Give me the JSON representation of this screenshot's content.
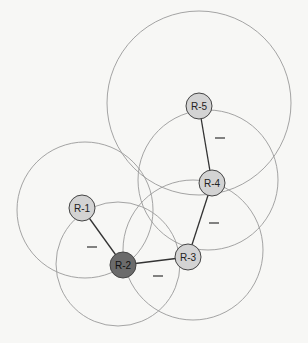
{
  "header_fragment": "",
  "diagram": {
    "type": "network-topology",
    "colors": {
      "node_fill": "#d3d3d3",
      "root_fill": "#6b6b6b",
      "range_stroke": "#9a9a9a",
      "link_stroke": "#333333"
    },
    "nodes": [
      {
        "id": "R-1",
        "label": "R-1",
        "x": 82,
        "y": 208,
        "range_r": 68,
        "cx": 85,
        "cy": 210,
        "root": false
      },
      {
        "id": "R-2",
        "label": "R-2",
        "x": 123,
        "y": 265,
        "range_r": 62,
        "cx": 118,
        "cy": 264,
        "root": true
      },
      {
        "id": "R-3",
        "label": "R-3",
        "x": 188,
        "y": 257,
        "range_r": 70,
        "cx": 193,
        "cy": 250,
        "root": false
      },
      {
        "id": "R-4",
        "label": "R-4",
        "x": 212,
        "y": 183,
        "range_r": 70,
        "cx": 208,
        "cy": 180,
        "root": false
      },
      {
        "id": "R-5",
        "label": "R-5",
        "x": 199,
        "y": 106,
        "range_r": 92,
        "cx": 199,
        "cy": 103,
        "root": false
      }
    ],
    "links": [
      {
        "from": "R-1",
        "to": "R-2",
        "mark": "—",
        "mx": 92,
        "my": 247
      },
      {
        "from": "R-2",
        "to": "R-3",
        "mark": "—",
        "mx": 158,
        "my": 276
      },
      {
        "from": "R-3",
        "to": "R-4",
        "mark": "—",
        "mx": 214,
        "my": 223
      },
      {
        "from": "R-4",
        "to": "R-5",
        "mark": "—",
        "mx": 220,
        "my": 138
      }
    ]
  }
}
